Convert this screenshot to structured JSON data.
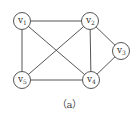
{
  "diagram": {
    "type": "undirected-graph",
    "nodes": [
      {
        "id": "v1",
        "label": "v",
        "sub": "1",
        "x": 22,
        "y": 21
      },
      {
        "id": "v2",
        "label": "v",
        "sub": "2",
        "x": 90,
        "y": 21
      },
      {
        "id": "v3",
        "label": "v",
        "sub": "3",
        "x": 121,
        "y": 51
      },
      {
        "id": "v4",
        "label": "v",
        "sub": "4",
        "x": 91,
        "y": 80
      },
      {
        "id": "v5",
        "label": "v",
        "sub": "5",
        "x": 22,
        "y": 80
      }
    ],
    "edges": [
      [
        "v1",
        "v2"
      ],
      [
        "v1",
        "v5"
      ],
      [
        "v1",
        "v4"
      ],
      [
        "v2",
        "v5"
      ],
      [
        "v2",
        "v4"
      ],
      [
        "v2",
        "v3"
      ],
      [
        "v3",
        "v4"
      ],
      [
        "v5",
        "v4"
      ]
    ],
    "caption": "（a）",
    "colors": {
      "stroke": "#555555",
      "fill": "#ffffff"
    }
  }
}
